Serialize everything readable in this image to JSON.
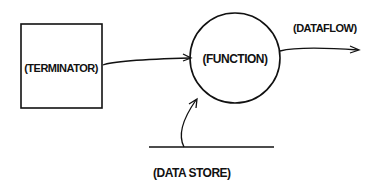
{
  "diagram": {
    "type": "data-flow-diagram",
    "nodes": [
      {
        "id": "terminator",
        "shape": "rectangle",
        "label": "(TERMINATOR)"
      },
      {
        "id": "function",
        "shape": "circle",
        "label": "(FUNCTION)"
      },
      {
        "id": "datastore",
        "shape": "open-line",
        "label": "(DATA STORE)"
      }
    ],
    "edges": [
      {
        "from": "terminator",
        "to": "function"
      },
      {
        "from": "datastore",
        "to": "function"
      },
      {
        "from": "function",
        "to": "outside",
        "label": "(DATAFLOW)"
      }
    ],
    "colors": {
      "ink": "#111111",
      "background": "#ffffff"
    }
  }
}
